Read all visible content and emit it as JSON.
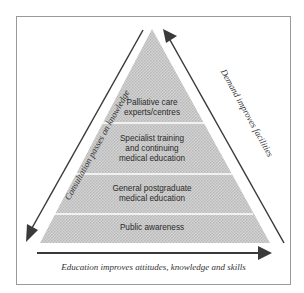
{
  "diagram": {
    "type": "pyramid",
    "tiers": [
      {
        "label_line1": "Palliative care",
        "label_line2": "experts/centres",
        "label_line3": ""
      },
      {
        "label_line1": "Specialist training",
        "label_line2": "and continuing",
        "label_line3": "medical education"
      },
      {
        "label_line1": "General postgraduate",
        "label_line2": "medical education",
        "label_line3": ""
      },
      {
        "label_line1": "Public awareness",
        "label_line2": "",
        "label_line3": ""
      }
    ],
    "left_arrow_label": "Consultation passes on knowledge",
    "right_arrow_label": "Demand improves facilities",
    "bottom_arrow_label": "Education improves attitudes, knowledge and skills",
    "colors": {
      "pyramid_fill": "#c9c9c9",
      "divider": "#ffffff",
      "arrow": "#3a3a3a",
      "frame": "#9a9a9a"
    }
  }
}
